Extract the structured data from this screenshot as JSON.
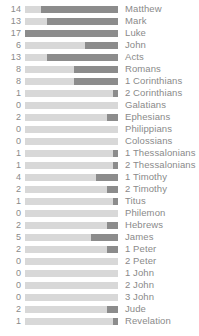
{
  "chart_data": {
    "type": "bar",
    "title": "",
    "subtitle": "",
    "xlabel": "",
    "ylabel": "",
    "orientation": "horizontal",
    "grid": false,
    "legend": null,
    "axis_visible": false,
    "value_labels_position": "left",
    "category_labels_position": "right",
    "track_max": 17,
    "xlim": [
      0,
      17
    ],
    "colors": {
      "track": "#d8d8d8",
      "bar": "#8c8c8c",
      "text": "#8a8a8a",
      "background": "#ffffff"
    },
    "categories": [
      "Matthew",
      "Mark",
      "Luke",
      "John",
      "Acts",
      "Romans",
      "1 Corinthians",
      "2 Corinthians",
      "Galatians",
      "Ephesians",
      "Philippians",
      "Colossians",
      "1 Thessalonians",
      "2 Thessalonians",
      "1 Timothy",
      "2 Timothy",
      "Titus",
      "Philemon",
      "Hebrews",
      "James",
      "1 Peter",
      "2 Peter",
      "1 John",
      "2 John",
      "3 John",
      "Jude",
      "Revelation"
    ],
    "values": [
      14,
      13,
      17,
      6,
      13,
      8,
      8,
      1,
      0,
      2,
      0,
      0,
      1,
      1,
      4,
      2,
      1,
      0,
      2,
      5,
      2,
      0,
      0,
      0,
      0,
      2,
      1
    ],
    "rows": [
      {
        "label": "Matthew",
        "value": 14
      },
      {
        "label": "Mark",
        "value": 13
      },
      {
        "label": "Luke",
        "value": 17
      },
      {
        "label": "John",
        "value": 6
      },
      {
        "label": "Acts",
        "value": 13
      },
      {
        "label": "Romans",
        "value": 8
      },
      {
        "label": "1 Corinthians",
        "value": 8
      },
      {
        "label": "2 Corinthians",
        "value": 1
      },
      {
        "label": "Galatians",
        "value": 0
      },
      {
        "label": "Ephesians",
        "value": 2
      },
      {
        "label": "Philippians",
        "value": 0
      },
      {
        "label": "Colossians",
        "value": 0
      },
      {
        "label": "1 Thessalonians",
        "value": 1
      },
      {
        "label": "2 Thessalonians",
        "value": 1
      },
      {
        "label": "1 Timothy",
        "value": 4
      },
      {
        "label": "2 Timothy",
        "value": 2
      },
      {
        "label": "Titus",
        "value": 1
      },
      {
        "label": "Philemon",
        "value": 0
      },
      {
        "label": "Hebrews",
        "value": 2
      },
      {
        "label": "James",
        "value": 5
      },
      {
        "label": "1 Peter",
        "value": 2
      },
      {
        "label": "2 Peter",
        "value": 0
      },
      {
        "label": "1 John",
        "value": 0
      },
      {
        "label": "2 John",
        "value": 0
      },
      {
        "label": "3 John",
        "value": 0
      },
      {
        "label": "Jude",
        "value": 2
      },
      {
        "label": "Revelation",
        "value": 1
      }
    ]
  }
}
